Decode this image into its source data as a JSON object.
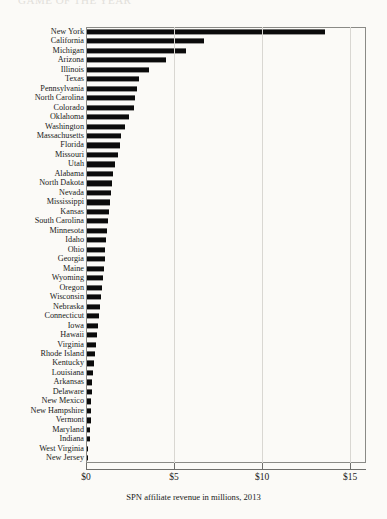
{
  "figure": {
    "running_head": "GAME OF THE YEAR",
    "background_color": "#fbfaf7",
    "bar_color": "#0b0b0b",
    "frame_color": "#8a8a86",
    "grid_color": "#d9d7d2"
  },
  "caption": "SPN affiliate revenue in millions, 2013",
  "axis": {
    "ticks": [
      {
        "value": 0,
        "label": "$0"
      },
      {
        "value": 5,
        "label": "$5"
      },
      {
        "value": 10,
        "label": "$10"
      },
      {
        "value": 15,
        "label": "$15"
      }
    ]
  },
  "chart_data": {
    "type": "bar",
    "orientation": "horizontal",
    "title": "",
    "subtitle": "",
    "xlabel": "SPN affiliate revenue in millions, 2013",
    "ylabel": "",
    "xlim": [
      0,
      15.9
    ],
    "grid": "vertical",
    "legend": "none",
    "unit": "millions of dollars",
    "year": 2013,
    "tick_labels": [
      "$0",
      "$5",
      "$10",
      "$15"
    ],
    "tick_values": [
      0,
      5,
      10,
      15
    ],
    "categories": [
      "New York",
      "California",
      "Michigan",
      "Arizona",
      "Illinois",
      "Texas",
      "Pennsylvania",
      "North Carolina",
      "Colorado",
      "Oklahoma",
      "Washington",
      "Massachusetts",
      "Florida",
      "Missouri",
      "Utah",
      "Alabama",
      "North Dakota",
      "Nevada",
      "Mississippi",
      "Kansas",
      "South Carolina",
      "Minnesota",
      "Idaho",
      "Ohio",
      "Georgia",
      "Maine",
      "Wyoming",
      "Oregon",
      "Wisconsin",
      "Nebraska",
      "Connecticut",
      "Iowa",
      "Hawaii",
      "Virginia",
      "Rhode Island",
      "Kentucky",
      "Louisiana",
      "Arkansas",
      "Delaware",
      "New Mexico",
      "New Hampshire",
      "Vermont",
      "Maryland",
      "Indiana",
      "West Virginia",
      "New Jersey"
    ],
    "values": [
      13.5,
      6.65,
      5.6,
      4.5,
      3.5,
      2.95,
      2.85,
      2.75,
      2.65,
      2.4,
      2.15,
      1.95,
      1.85,
      1.75,
      1.6,
      1.45,
      1.4,
      1.35,
      1.3,
      1.25,
      1.2,
      1.15,
      1.1,
      1.05,
      1.0,
      0.95,
      0.9,
      0.85,
      0.8,
      0.75,
      0.7,
      0.6,
      0.55,
      0.5,
      0.45,
      0.4,
      0.35,
      0.3,
      0.28,
      0.25,
      0.22,
      0.2,
      0.18,
      0.15,
      0.05,
      0.02
    ]
  }
}
